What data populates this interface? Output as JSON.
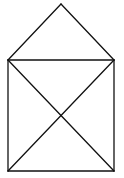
{
  "diagram": {
    "title": "",
    "stroke_color": "#111111",
    "background": "#ffffff",
    "vertices": {
      "apex": [
        61,
        4
      ],
      "top_left": [
        8,
        60
      ],
      "top_right": [
        114,
        60
      ],
      "bottom_left": [
        8,
        171
      ],
      "bottom_right": [
        114,
        171
      ]
    },
    "edges": [
      [
        "apex",
        "top_left"
      ],
      [
        "apex",
        "top_right"
      ],
      [
        "top_left",
        "top_right"
      ],
      [
        "top_left",
        "bottom_left"
      ],
      [
        "top_right",
        "bottom_right"
      ],
      [
        "bottom_left",
        "bottom_right"
      ],
      [
        "top_left",
        "bottom_right"
      ],
      [
        "top_right",
        "bottom_left"
      ]
    ]
  }
}
